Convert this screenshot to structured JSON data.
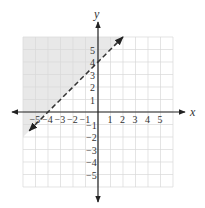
{
  "chart_data": {
    "type": "line",
    "title": "",
    "xlabel": "x",
    "ylabel": "y",
    "xlim": [
      -6,
      6
    ],
    "ylim": [
      -6,
      6
    ],
    "grid": true,
    "x_ticks": [
      "-5",
      "-4",
      "-3",
      "-2",
      "-1",
      "1",
      "2",
      "3",
      "4",
      "5"
    ],
    "y_ticks": [
      "5",
      "4",
      "3",
      "2",
      "1",
      "-1",
      "-2",
      "-3",
      "-4",
      "-5"
    ],
    "boundary_line": {
      "equation": "y = x + 4",
      "style": "dashed",
      "points": [
        [
          -5.5,
          -1.5
        ],
        [
          2,
          6
        ]
      ],
      "intercepts": {
        "x": -4,
        "y": 4
      }
    },
    "shaded_region": {
      "description": "region above the line (y > x + 4)",
      "color": "#e6e6e6"
    },
    "legend": null
  },
  "colors": {
    "grid": "#d9d9d9",
    "axis": "#222222",
    "line": "#333333",
    "shade": "#e8e8e8"
  }
}
